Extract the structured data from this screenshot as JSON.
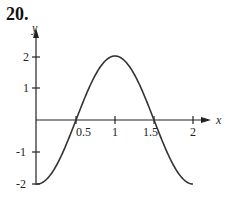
{
  "problem_number": "20.",
  "chart_data": {
    "type": "line",
    "title": "",
    "xlabel": "x",
    "ylabel": "y",
    "x_ticks": [
      "0.5",
      "1",
      "1.5",
      "2"
    ],
    "y_ticks": [
      "2",
      "1",
      "-1",
      "-2"
    ],
    "xlim": [
      0,
      2
    ],
    "ylim": [
      -2,
      2
    ],
    "grid": false,
    "function": "y = -2cos(pi x)",
    "x": [
      0,
      0.25,
      0.5,
      0.75,
      1,
      1.25,
      1.5,
      1.75,
      2
    ],
    "y": [
      -2,
      -1.414,
      0,
      1.414,
      2,
      1.414,
      0,
      -1.414,
      -2
    ]
  }
}
